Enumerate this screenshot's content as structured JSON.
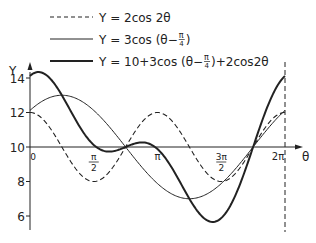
{
  "chart_data": {
    "type": "line",
    "title": "",
    "xlabel": "θ",
    "ylabel": "Y",
    "xlim": [
      0,
      6.2832
    ],
    "ylim": [
      5,
      14.5
    ],
    "grid": false,
    "legend_position": "top",
    "x_ticks": [
      {
        "value": 0,
        "label": "0"
      },
      {
        "value": 1.5708,
        "label_num": "π",
        "label_den": "2"
      },
      {
        "value": 3.1416,
        "label": "π"
      },
      {
        "value": 4.7124,
        "label_num": "3π",
        "label_den": "2"
      },
      {
        "value": 6.2832,
        "label": "2π"
      }
    ],
    "y_ticks": [
      6,
      8,
      10,
      12,
      14
    ],
    "series": [
      {
        "name": "Y = 2cos 2θ",
        "style": "dashed",
        "width": 1.1,
        "offset": 10,
        "formula": "10 + 2cos(2θ)"
      },
      {
        "name": "Y = 3cos (θ−π/4)",
        "style": "solid",
        "width": 1.0,
        "offset": 10,
        "formula": "10 + 3cos(θ−π/4)"
      },
      {
        "name": "Y = 10+3cos (θ−π/4)+2cos2θ",
        "style": "solid",
        "width": 2.0,
        "offset": 0,
        "formula": "10 + 3cos(θ−π/4) + 2cos(2θ)"
      }
    ],
    "annotations": [
      "vertical dashed line at θ = 2π"
    ]
  },
  "legend": {
    "items": [
      {
        "prefix": "Y = 2cos 2θ",
        "suffix": ""
      },
      {
        "prefix": "Y = 3cos (θ−",
        "frac_num": "π",
        "frac_den": "4",
        "suffix": ")"
      },
      {
        "prefix": "Y = 10+3cos (θ−",
        "frac_num": "π",
        "frac_den": "4",
        "suffix": ")+2cos2θ"
      }
    ]
  },
  "colors": {
    "ink": "#222222",
    "background": "#ffffff"
  }
}
